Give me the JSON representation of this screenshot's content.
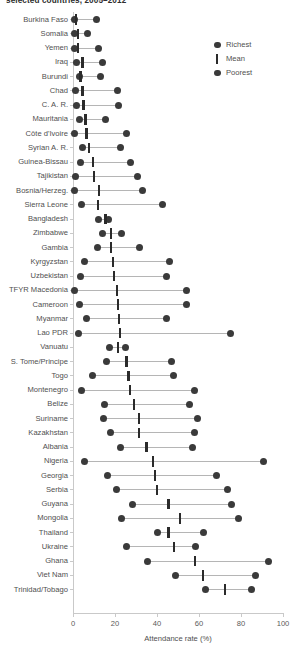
{
  "chart_data": {
    "type": "scatter",
    "title": "selected countries, 2005–2012",
    "xlabel": "Attendance rate (%)",
    "ylabel": "",
    "xlim": [
      0,
      100
    ],
    "xticks": [
      0,
      20,
      40,
      60,
      80,
      100
    ],
    "grid": false,
    "legend_position": "top-right",
    "legend": [
      {
        "name": "Richest",
        "marker": "dot"
      },
      {
        "name": "Mean",
        "marker": "bar"
      },
      {
        "name": "Poorest",
        "marker": "dot"
      }
    ],
    "series": [
      {
        "name": "Poorest"
      },
      {
        "name": "Mean"
      },
      {
        "name": "Richest"
      }
    ],
    "categories": [
      "Burkina Faso",
      "Somalia",
      "Yemen",
      "Iraq",
      "Burundi",
      "Chad",
      "C. A. R.",
      "Mauritania",
      "Côte d'Ivoire",
      "Syrian A. R.",
      "Guinea-Bissau",
      "Tajikistan",
      "Bosnia/Herzeg.",
      "Sierra Leone",
      "Bangladesh",
      "Zimbabwe",
      "Gambia",
      "Kyrgyzstan",
      "Uzbekistan",
      "TFYR Macedonia",
      "Cameroon",
      "Myanmar",
      "Lao PDR",
      "Vanuatu",
      "S. Tome/Principe",
      "Togo",
      "Montenegro",
      "Belize",
      "Suriname",
      "Kazakhstan",
      "Albania",
      "Nigeria",
      "Georgia",
      "Serbia",
      "Guyana",
      "Mongolia",
      "Thailand",
      "Ukraine",
      "Ghana",
      "Viet Nam",
      "Trinidad/Tobago"
    ],
    "rows": [
      {
        "country": "Burkina Faso",
        "poorest": 0.5,
        "mean": 1.5,
        "richest": 11.0
      },
      {
        "country": "Somalia",
        "poorest": 0.5,
        "mean": 2.5,
        "richest": 7.0
      },
      {
        "country": "Yemen",
        "poorest": 0.5,
        "mean": 2.5,
        "richest": 12.0
      },
      {
        "country": "Iraq",
        "poorest": 1.5,
        "mean": 4.5,
        "richest": 14.0
      },
      {
        "country": "Burundi",
        "poorest": 3.0,
        "mean": 3.5,
        "richest": 13.0
      },
      {
        "country": "Chad",
        "poorest": 1.0,
        "mean": 4.5,
        "richest": 21.0
      },
      {
        "country": "C. A. R.",
        "poorest": 1.5,
        "mean": 5.0,
        "richest": 21.5
      },
      {
        "country": "Mauritania",
        "poorest": 3.0,
        "mean": 6.0,
        "richest": 15.5
      },
      {
        "country": "Côte d'Ivoire",
        "poorest": 0.5,
        "mean": 6.5,
        "richest": 25.5
      },
      {
        "country": "Syrian A. R.",
        "poorest": 4.5,
        "mean": 7.5,
        "richest": 22.5
      },
      {
        "country": "Guinea-Bissau",
        "poorest": 3.5,
        "mean": 9.5,
        "richest": 27.5
      },
      {
        "country": "Tajikistan",
        "poorest": 1.0,
        "mean": 10.0,
        "richest": 30.5
      },
      {
        "country": "Bosnia/Herzeg.",
        "poorest": 0.5,
        "mean": 12.5,
        "richest": 33.0
      },
      {
        "country": "Sierra Leone",
        "poorest": 4.0,
        "mean": 12.0,
        "richest": 42.5
      },
      {
        "country": "Bangladesh",
        "poorest": 12.0,
        "mean": 15.5,
        "richest": 17.0
      },
      {
        "country": "Zimbabwe",
        "poorest": 14.0,
        "mean": 18.0,
        "richest": 23.0
      },
      {
        "country": "Gambia",
        "poorest": 11.5,
        "mean": 18.0,
        "richest": 31.5
      },
      {
        "country": "Kyrgyzstan",
        "poorest": 5.5,
        "mean": 19.0,
        "richest": 46.0
      },
      {
        "country": "Uzbekistan",
        "poorest": 3.5,
        "mean": 19.5,
        "richest": 44.5
      },
      {
        "country": "TFYR Macedonia",
        "poorest": 0.5,
        "mean": 21.0,
        "richest": 54.0
      },
      {
        "country": "Cameroon",
        "poorest": 3.0,
        "mean": 21.5,
        "richest": 54.0
      },
      {
        "country": "Myanmar",
        "poorest": 6.5,
        "mean": 22.0,
        "richest": 44.5
      },
      {
        "country": "Lao PDR",
        "poorest": 2.5,
        "mean": 22.5,
        "richest": 75.0
      },
      {
        "country": "Vanuatu",
        "poorest": 17.5,
        "mean": 21.5,
        "richest": 25.0
      },
      {
        "country": "S. Tome/Principe",
        "poorest": 16.0,
        "mean": 25.5,
        "richest": 47.0
      },
      {
        "country": "Togo",
        "poorest": 9.5,
        "mean": 26.5,
        "richest": 48.0
      },
      {
        "country": "Montenegro",
        "poorest": 4.0,
        "mean": 27.0,
        "richest": 58.0
      },
      {
        "country": "Belize",
        "poorest": 15.0,
        "mean": 29.0,
        "richest": 55.5
      },
      {
        "country": "Suriname",
        "poorest": 14.5,
        "mean": 31.5,
        "richest": 59.5
      },
      {
        "country": "Kazakhstan",
        "poorest": 18.0,
        "mean": 31.5,
        "richest": 58.0
      },
      {
        "country": "Albania",
        "poorest": 22.5,
        "mean": 35.0,
        "richest": 57.0
      },
      {
        "country": "Nigeria",
        "poorest": 5.5,
        "mean": 38.0,
        "richest": 90.5
      },
      {
        "country": "Georgia",
        "poorest": 16.5,
        "mean": 39.0,
        "richest": 68.5
      },
      {
        "country": "Serbia",
        "poorest": 20.5,
        "mean": 40.0,
        "richest": 73.5
      },
      {
        "country": "Guyana",
        "poorest": 28.5,
        "mean": 45.5,
        "richest": 75.5
      },
      {
        "country": "Mongolia",
        "poorest": 23.0,
        "mean": 51.0,
        "richest": 79.0
      },
      {
        "country": "Thailand",
        "poorest": 40.0,
        "mean": 45.5,
        "richest": 62.0
      },
      {
        "country": "Ukraine",
        "poorest": 25.5,
        "mean": 48.0,
        "richest": 58.5
      },
      {
        "country": "Ghana",
        "poorest": 35.5,
        "mean": 58.0,
        "richest": 93.0
      },
      {
        "country": "Viet Nam",
        "poorest": 49.0,
        "mean": 62.0,
        "richest": 87.0
      },
      {
        "country": "Trinidad/Tobago",
        "poorest": 63.0,
        "mean": 72.5,
        "richest": 85.0
      }
    ]
  }
}
